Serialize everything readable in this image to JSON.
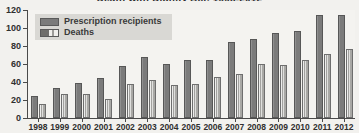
{
  "chart_data": {
    "type": "bar",
    "title": "Death with Dignity Act, 1998-2012",
    "xlabel": "",
    "ylabel": "",
    "ylim": [
      0,
      120
    ],
    "yticks": [
      0,
      20,
      40,
      60,
      80,
      100,
      120
    ],
    "grid": false,
    "legend_position": "top-left",
    "categories": [
      "1998",
      "1999",
      "2000",
      "2001",
      "2002",
      "2003",
      "2004",
      "2005",
      "2006",
      "2007",
      "2008",
      "2009",
      "2010",
      "2011",
      "2012"
    ],
    "series": [
      {
        "name": "Prescription recipients",
        "color": "#7b7b7b",
        "values": [
          24,
          33,
          39,
          44,
          58,
          68,
          60,
          65,
          65,
          85,
          88,
          95,
          97,
          114,
          115
        ]
      },
      {
        "name": "Deaths",
        "color": "#b9b8b4",
        "values": [
          16,
          27,
          27,
          21,
          38,
          42,
          37,
          38,
          46,
          49,
          60,
          59,
          65,
          71,
          77
        ]
      }
    ]
  },
  "axis": {
    "y_tick_labels": [
      "0",
      "20",
      "40",
      "60",
      "80",
      "100",
      "120"
    ],
    "x_tick_labels": [
      "1998",
      "1999",
      "2000",
      "2001",
      "2002",
      "2003",
      "2004",
      "2005",
      "2006",
      "2007",
      "2008",
      "2009",
      "2010",
      "2011",
      "2012"
    ]
  },
  "legend": {
    "items": [
      {
        "label": "Prescription recipients",
        "swatch": "legend-swatch-prescriptions"
      },
      {
        "label": "Deaths",
        "swatch": "legend-swatch-deaths"
      }
    ]
  }
}
